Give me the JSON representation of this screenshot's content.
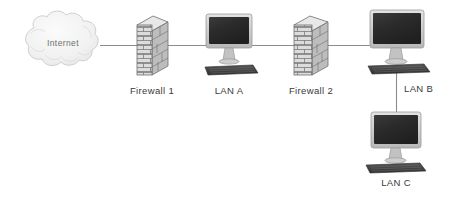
{
  "diagram": {
    "background_color": "#ffffff",
    "link_color": "#8c8c8c",
    "label_color": "#3a3a3a",
    "cloud_label_color": "#6e6e6e"
  },
  "nodes": {
    "internet": {
      "label": "Internet",
      "icon": "cloud-icon",
      "x": 63,
      "y": 43
    },
    "firewall1": {
      "label": "Firewall 1",
      "icon": "brick-wall-icon",
      "x": 152,
      "y": 91
    },
    "lanA": {
      "label": "LAN A",
      "icon": "desktop-computer-icon",
      "x": 229,
      "y": 91
    },
    "firewall2": {
      "label": "Firewall 2",
      "icon": "brick-wall-icon",
      "x": 311,
      "y": 91
    },
    "lanB": {
      "label": "LAN B",
      "icon": "desktop-computer-icon",
      "x": 420,
      "y": 89
    },
    "lanC": {
      "label": "LAN C",
      "icon": "desktop-computer-icon",
      "x": 399,
      "y": 180
    }
  },
  "links": [
    {
      "name": "internet-to-firewall1",
      "from": "internet",
      "to": "firewall1"
    },
    {
      "name": "firewall1-to-lanA",
      "from": "firewall1",
      "to": "lanA"
    },
    {
      "name": "lanA-to-firewall2",
      "from": "lanA",
      "to": "firewall2"
    },
    {
      "name": "firewall2-to-lanB",
      "from": "firewall2",
      "to": "lanB"
    },
    {
      "name": "lanB-to-lanC",
      "from": "lanB",
      "to": "lanC"
    }
  ],
  "colors": {
    "brick_face": "#d6d6d6",
    "brick_side": "#b4b4b4",
    "brick_top": "#e6e6e6",
    "brick_line": "#6f6f6f",
    "screen_dark": "#2a2a2a",
    "bezel": "#c9c9c9",
    "keyboard": "#3d3d3d",
    "cloud_fill": "#f2f2f2",
    "cloud_stroke": "#cfcfcf"
  }
}
